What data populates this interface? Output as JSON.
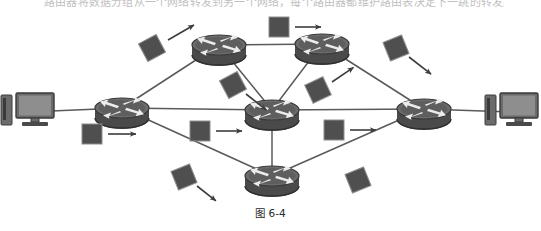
{
  "figure": {
    "caption": "图 6-4",
    "cut_off_header_text": "路由器将数据分组从一个网络转发到另一个网络，每个路由器都维护路由表决定下一跳的转发路径",
    "colors": {
      "device_dark": "#4a4a4a",
      "device_mid": "#6b6b6b",
      "device_light": "#9a9a9a",
      "link": "#5a5a5a",
      "packet": "#4f4f4f",
      "arrow": "#3d3d3d",
      "background": "#ffffff"
    }
  },
  "nodes": {
    "computers": [
      {
        "id": "pc-left",
        "name": "left-computer",
        "x": 28,
        "y": 112
      },
      {
        "id": "pc-right",
        "name": "right-computer",
        "x": 512,
        "y": 112
      }
    ],
    "routers": [
      {
        "id": "r-left",
        "name": "left-router",
        "x": 122,
        "y": 108
      },
      {
        "id": "r-top-left",
        "name": "top-left-router",
        "x": 219,
        "y": 45
      },
      {
        "id": "r-top-right",
        "name": "top-right-router",
        "x": 322,
        "y": 44
      },
      {
        "id": "r-center",
        "name": "center-router",
        "x": 272,
        "y": 110
      },
      {
        "id": "r-bottom",
        "name": "bottom-router",
        "x": 272,
        "y": 176
      },
      {
        "id": "r-right",
        "name": "right-router",
        "x": 424,
        "y": 109
      }
    ]
  },
  "links": [
    {
      "from": "pc-left",
      "to": "r-left"
    },
    {
      "from": "r-left",
      "to": "r-top-left"
    },
    {
      "from": "r-left",
      "to": "r-center"
    },
    {
      "from": "r-left",
      "to": "r-bottom"
    },
    {
      "from": "r-top-left",
      "to": "r-top-right"
    },
    {
      "from": "r-top-left",
      "to": "r-center"
    },
    {
      "from": "r-top-right",
      "to": "r-center"
    },
    {
      "from": "r-top-right",
      "to": "r-right"
    },
    {
      "from": "r-center",
      "to": "r-bottom"
    },
    {
      "from": "r-center",
      "to": "r-right"
    },
    {
      "from": "r-bottom",
      "to": "r-right"
    },
    {
      "from": "r-right",
      "to": "pc-right"
    }
  ],
  "packets": [
    {
      "id": "p1",
      "name": "packet-top-left-diagonal",
      "x": 152,
      "y": 48,
      "rot": -28,
      "arrow": "up-right",
      "arrow_x": 168,
      "arrow_y": 40,
      "arrow_angle": -30,
      "arrow_len": 30
    },
    {
      "id": "p2",
      "name": "packet-top-center",
      "x": 279,
      "y": 27,
      "rot": 0,
      "arrow": "right",
      "arrow_x": 295,
      "arrow_y": 27,
      "arrow_angle": 0,
      "arrow_len": 26
    },
    {
      "id": "p3",
      "name": "packet-top-right-diagonal",
      "x": 396,
      "y": 48,
      "rot": -22,
      "arrow": "down-right",
      "arrow_x": 409,
      "arrow_y": 57,
      "arrow_angle": 38,
      "arrow_len": 28
    },
    {
      "id": "p4",
      "name": "packet-upper-mid-left",
      "x": 233,
      "y": 85,
      "rot": -28,
      "arrow": "down-right",
      "arrow_x": 246,
      "arrow_y": 94,
      "arrow_angle": 38,
      "arrow_len": 26
    },
    {
      "id": "p5",
      "name": "packet-upper-mid-right",
      "x": 318,
      "y": 90,
      "rot": -25,
      "arrow": "up-right",
      "arrow_x": 332,
      "arrow_y": 82,
      "arrow_angle": -34,
      "arrow_len": 26
    },
    {
      "id": "p6",
      "name": "packet-left-lower",
      "x": 92,
      "y": 134,
      "rot": 0,
      "arrow": "right",
      "arrow_x": 108,
      "arrow_y": 134,
      "arrow_angle": 0,
      "arrow_len": 28
    },
    {
      "id": "p7",
      "name": "packet-center-lower-left",
      "x": 200,
      "y": 131,
      "rot": 0,
      "arrow": "right",
      "arrow_x": 216,
      "arrow_y": 131,
      "arrow_angle": 0,
      "arrow_len": 26
    },
    {
      "id": "p8",
      "name": "packet-center-lower-right",
      "x": 334,
      "y": 130,
      "rot": 0,
      "arrow": "right",
      "arrow_x": 350,
      "arrow_y": 130,
      "arrow_angle": 0,
      "arrow_len": 26
    },
    {
      "id": "p9",
      "name": "packet-bottom-left",
      "x": 184,
      "y": 177,
      "rot": -22,
      "arrow": "down-right",
      "arrow_x": 197,
      "arrow_y": 186,
      "arrow_angle": 38,
      "arrow_len": 24
    },
    {
      "id": "p10",
      "name": "packet-bottom-right",
      "x": 358,
      "y": 180,
      "rot": -22,
      "arrow": "none",
      "arrow_x": 0,
      "arrow_y": 0,
      "arrow_angle": 0,
      "arrow_len": 0
    }
  ]
}
